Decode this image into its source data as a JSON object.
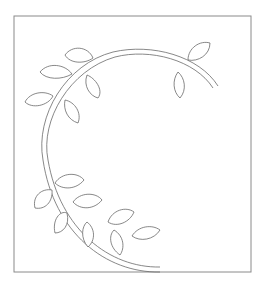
{
  "pattern": {
    "title": "Letter A applique pattern",
    "letter": "A",
    "labels": [
      {
        "id": "1",
        "text": "1",
        "x": 158,
        "y": 128,
        "size": 13
      },
      {
        "id": "2",
        "text": "2",
        "x": 96,
        "y": 63,
        "size": 13
      },
      {
        "id": "3",
        "text": "3",
        "x": 73,
        "y": 62,
        "size": 13
      },
      {
        "id": "4",
        "text": "4",
        "x": 132,
        "y": 66,
        "size": 15
      },
      {
        "id": "5",
        "text": "5",
        "x": 204,
        "y": 99,
        "size": 13
      }
    ],
    "colors": {
      "line": "#6a6a6a",
      "frame": "#8a8a8a",
      "label": "#222222",
      "background": "#ffffff"
    }
  }
}
